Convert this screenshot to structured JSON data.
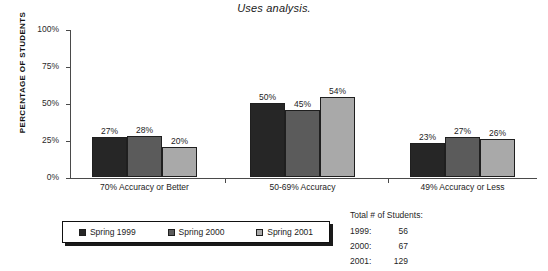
{
  "chart_data": {
    "type": "bar",
    "title": "Uses analysis.",
    "xlabel": "",
    "ylabel": "PERCENTAGE OF STUDENTS",
    "ylim": [
      0,
      100
    ],
    "ytick_labels": [
      "100%",
      "75%",
      "50%",
      "25%",
      "0%"
    ],
    "ytick_values": [
      100,
      75,
      50,
      25,
      0
    ],
    "grid": false,
    "legend_position": "bottom-left",
    "categories": [
      "70% Accuracy or Better",
      "50-69% Accuracy",
      "49% Accuracy or Less"
    ],
    "series": [
      {
        "name": "Spring 1999",
        "color": "#262626",
        "values": [
          27,
          50,
          23
        ],
        "labels": [
          "27%",
          "50%",
          "23%"
        ]
      },
      {
        "name": "Spring 2000",
        "color": "#5b5b5b",
        "values": [
          28,
          45,
          27
        ],
        "labels": [
          "28%",
          "45%",
          "27%"
        ]
      },
      {
        "name": "Spring 2001",
        "color": "#a9a9a9",
        "values": [
          20,
          54,
          26
        ],
        "labels": [
          "20%",
          "54%",
          "26%"
        ]
      }
    ],
    "annotations": {
      "totals_heading": "Total # of Students:",
      "totals": [
        {
          "year": "1999:",
          "count": "56"
        },
        {
          "year": "2000:",
          "count": "67"
        },
        {
          "year": "2001:",
          "count": "129"
        }
      ]
    }
  }
}
